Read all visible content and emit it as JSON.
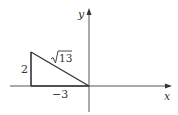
{
  "diagram": {
    "type": "right-triangle-on-axes",
    "axes": {
      "x_label": "x",
      "y_label": "y"
    },
    "labels": {
      "vertical_leg": "2",
      "horizontal_leg": "−3",
      "hypotenuse_radicand": "13",
      "hypotenuse": "√13"
    },
    "colors": {
      "stroke": "#444444",
      "text": "#333333",
      "background": "#ffffff"
    }
  }
}
